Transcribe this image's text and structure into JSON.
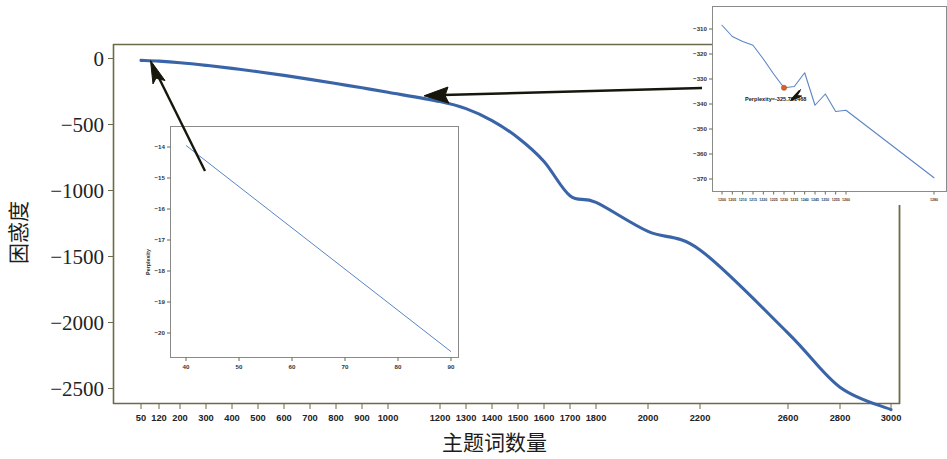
{
  "figure": {
    "background": "#ffffff",
    "accent_color": "#3a64a8",
    "inset_line_color": "#5b85c4",
    "marker_color": "#d1632a",
    "axis_color": "#6b6a4a"
  },
  "chart_data": {
    "type": "line",
    "title": "",
    "xlabel": "主题词数量",
    "ylabel": "困惑度",
    "grid": false,
    "legend": null,
    "xlim": [
      0,
      3100
    ],
    "ylim": [
      -2750,
      120
    ],
    "xticks": [
      50,
      120,
      200,
      300,
      400,
      500,
      600,
      700,
      800,
      900,
      1000,
      1200,
      1300,
      1400,
      1500,
      1600,
      1700,
      1800,
      2000,
      2200,
      2600,
      2800,
      3000
    ],
    "xtick_labels": [
      "50",
      "120",
      "200",
      "300",
      "400",
      "500",
      "600",
      "700",
      "800",
      "900",
      "1000",
      "1200",
      "1300",
      "1400",
      "1500",
      "1600",
      "1700",
      "1800",
      "2000",
      "2200",
      "2600",
      "2800",
      "3000"
    ],
    "yticks": [
      0,
      -500,
      -1000,
      -1500,
      -2000,
      -2500
    ],
    "ytick_labels": [
      "0",
      "−500",
      "−1000",
      "−1500",
      "−2000",
      "−2500"
    ],
    "series": [
      {
        "name": "Perplexity",
        "color": "#3a64a8",
        "x": [
          50,
          120,
          200,
          300,
          400,
          500,
          600,
          700,
          800,
          900,
          1000,
          1200,
          1300,
          1400,
          1500,
          1600,
          1700,
          1800,
          2000,
          2200,
          2600,
          2800,
          3000
        ],
        "y": [
          -14,
          -20,
          -32,
          -52,
          -75,
          -100,
          -128,
          -158,
          -190,
          -222,
          -256,
          -326,
          -380,
          -470,
          -600,
          -780,
          -1040,
          -1090,
          -1310,
          -1450,
          -2080,
          -2490,
          -2660
        ]
      }
    ],
    "insets": [
      {
        "name": "inset-left",
        "type": "line",
        "xlabel": "",
        "ylabel": "Perplexity",
        "xticks": [
          40,
          50,
          60,
          70,
          80,
          90
        ],
        "xtick_labels": [
          "40",
          "50",
          "60",
          "70",
          "80",
          "90"
        ],
        "yticks": [
          -14,
          -15,
          -16,
          -17,
          -18,
          -19,
          -20
        ],
        "ytick_labels": [
          "−14",
          "−15",
          "−16",
          "−17",
          "−18",
          "−19",
          "−20"
        ],
        "xlim": [
          37,
          93
        ],
        "ylim": [
          -20.9,
          -13.6
        ],
        "series": [
          {
            "name": "Perplexity",
            "color": "#5b85c4",
            "x": [
              40,
              90
            ],
            "y": [
              -13.95,
              -20.6
            ]
          }
        ]
      },
      {
        "name": "inset-right",
        "type": "line",
        "xlabel": "",
        "ylabel": "",
        "xticks": [
          1200,
          1205,
          1210,
          1215,
          1220,
          1225,
          1230,
          1235,
          1240,
          1245,
          1250,
          1255,
          1260,
          1280
        ],
        "xtick_labels": [
          "1200",
          "1205",
          "1210",
          "1215",
          "1220",
          "1225",
          "1230",
          "1235",
          "1240",
          "1245",
          "1250",
          "1255",
          "1260",
          "1280"
        ],
        "yticks": [
          -310,
          -320,
          -330,
          -340,
          -350,
          -360,
          -370
        ],
        "ytick_labels": [
          "−310",
          "−320",
          "−330",
          "−340",
          "−350",
          "−360",
          "−370"
        ],
        "xlim": [
          1198,
          1282
        ],
        "ylim": [
          -372,
          -306
        ],
        "annotation": {
          "text": "Perplexity=-325.781468",
          "marker_x": 1230,
          "marker_y": -333.5
        },
        "series": [
          {
            "name": "Perplexity",
            "color": "#5b85c4",
            "x": [
              1200,
              1205,
              1210,
              1215,
              1220,
              1225,
              1230,
              1235,
              1240,
              1245,
              1250,
              1255,
              1260,
              1280
            ],
            "y": [
              -308.5,
              -313.0,
              -315.0,
              -316.5,
              -322.0,
              -328.0,
              -333.5,
              -333.0,
              -327.5,
              -340.5,
              -336.0,
              -343.0,
              -342.5,
              -369.5
            ]
          }
        ]
      }
    ],
    "callouts": [
      {
        "name": "arrow-to-left-inset",
        "from": "inset-left",
        "to_series_point_x": 120
      },
      {
        "name": "arrow-to-right-inset",
        "from": "inset-right",
        "to_series_point_x": 1230
      }
    ]
  }
}
